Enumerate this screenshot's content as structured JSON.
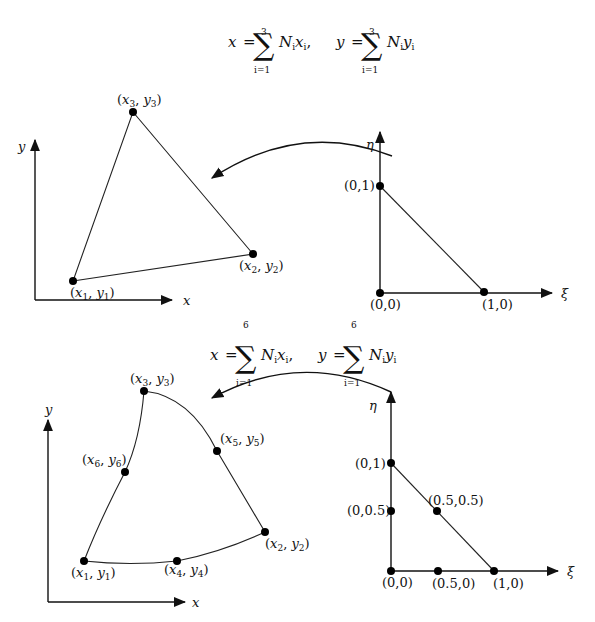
{
  "diagram": {
    "linear_element": {
      "mapping_formula": {
        "x_lhs": "x",
        "y_lhs": "y",
        "equals": "=",
        "sum_upper": "3",
        "sum_lower": "i=1",
        "x_term": "N",
        "x_term_sub": "i",
        "x_term_var": "x",
        "x_term_var_sub": "i",
        "separator": ",",
        "y_term": "N",
        "y_term_sub": "i",
        "y_term_var": "y",
        "y_term_var_sub": "i"
      },
      "physical": {
        "axis_x_label": "x",
        "axis_y_label": "y",
        "nodes": [
          {
            "id": 1,
            "label_base_x": "x",
            "label_base_y": "y",
            "sub": "1"
          },
          {
            "id": 2,
            "label_base_x": "x",
            "label_base_y": "y",
            "sub": "2"
          },
          {
            "id": 3,
            "label_base_x": "x",
            "label_base_y": "y",
            "sub": "3"
          }
        ]
      },
      "reference": {
        "axis_xi_label": "ξ",
        "axis_eta_label": "η",
        "nodes": [
          {
            "label": "(0,0)"
          },
          {
            "label": "(1,0)"
          },
          {
            "label": "(0,1)"
          }
        ]
      }
    },
    "quadratic_element": {
      "mapping_formula": {
        "x_lhs": "x",
        "y_lhs": "y",
        "equals": "=",
        "sum_upper": "6",
        "sum_lower": "i=1",
        "x_term": "N",
        "x_term_sub": "i",
        "x_term_var": "x",
        "x_term_var_sub": "i",
        "separator": ",",
        "y_term": "N",
        "y_term_sub": "i",
        "y_term_var": "y",
        "y_term_var_sub": "i"
      },
      "physical": {
        "axis_x_label": "x",
        "axis_y_label": "y",
        "nodes": [
          {
            "id": 1,
            "label_base_x": "x",
            "label_base_y": "y",
            "sub": "1"
          },
          {
            "id": 2,
            "label_base_x": "x",
            "label_base_y": "y",
            "sub": "2"
          },
          {
            "id": 3,
            "label_base_x": "x",
            "label_base_y": "y",
            "sub": "3"
          },
          {
            "id": 4,
            "label_base_x": "x",
            "label_base_y": "y",
            "sub": "4"
          },
          {
            "id": 5,
            "label_base_x": "x",
            "label_base_y": "y",
            "sub": "5"
          },
          {
            "id": 6,
            "label_base_x": "x",
            "label_base_y": "y",
            "sub": "6"
          }
        ]
      },
      "reference": {
        "axis_xi_label": "ξ",
        "axis_eta_label": "η",
        "nodes": [
          {
            "label": "(0,0)"
          },
          {
            "label": "(1,0)"
          },
          {
            "label": "(0,1)"
          },
          {
            "label": "(0.5,0)"
          },
          {
            "label": "(0.5,0.5)"
          },
          {
            "label": "(0,0.5)"
          }
        ]
      }
    },
    "punct": {
      "open": "(",
      "comma": ", ",
      "close": ")"
    }
  }
}
